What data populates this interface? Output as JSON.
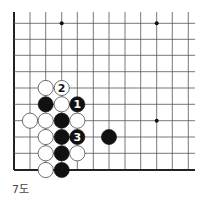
{
  "diagram": {
    "caption": "7도",
    "grid": {
      "x_lines": [
        14,
        30,
        45.7,
        61.7,
        77.3,
        93.3,
        109,
        125,
        140.7,
        156.7,
        172.3,
        188.3
      ],
      "y_lines": [
        23.3,
        39.3,
        55.3,
        71.7,
        88,
        104.3,
        120.7,
        137,
        153.3,
        170
      ],
      "line_color": "#555555",
      "edge_color": "#222222",
      "top_extend": 12,
      "right_extend": 195,
      "left_edge_col": 0,
      "bottom_edge_row": 9
    },
    "star_points": [
      {
        "col": 3,
        "row": 0
      },
      {
        "col": 9,
        "row": 0
      },
      {
        "col": 9,
        "row": 6
      }
    ],
    "stones": [
      {
        "color": "white",
        "col": 2,
        "row": 4,
        "label": ""
      },
      {
        "color": "white",
        "col": 3,
        "row": 4,
        "label": "2"
      },
      {
        "color": "black",
        "col": 2,
        "row": 5,
        "label": ""
      },
      {
        "color": "white",
        "col": 3,
        "row": 5,
        "label": ""
      },
      {
        "color": "black",
        "col": 4,
        "row": 5,
        "label": "1"
      },
      {
        "color": "white",
        "col": 1,
        "row": 6,
        "label": ""
      },
      {
        "color": "white",
        "col": 2,
        "row": 6,
        "label": ""
      },
      {
        "color": "black",
        "col": 3,
        "row": 6,
        "label": ""
      },
      {
        "color": "white",
        "col": 4,
        "row": 6,
        "label": ""
      },
      {
        "color": "white",
        "col": 2,
        "row": 7,
        "label": ""
      },
      {
        "color": "black",
        "col": 3,
        "row": 7,
        "label": ""
      },
      {
        "color": "black",
        "col": 4,
        "row": 7,
        "label": "3"
      },
      {
        "color": "black",
        "col": 6,
        "row": 7,
        "label": ""
      },
      {
        "color": "white",
        "col": 2,
        "row": 8,
        "label": ""
      },
      {
        "color": "black",
        "col": 3,
        "row": 8,
        "label": ""
      },
      {
        "color": "white",
        "col": 4,
        "row": 8,
        "label": ""
      },
      {
        "color": "white",
        "col": 2,
        "row": 9,
        "label": ""
      },
      {
        "color": "black",
        "col": 3,
        "row": 9,
        "label": ""
      }
    ],
    "colors": {
      "black_stone": "#111111",
      "white_stone": "#ffffff",
      "white_stone_stroke": "#333333",
      "label_on_black": "#ffffff",
      "label_on_white": "#111111"
    }
  }
}
